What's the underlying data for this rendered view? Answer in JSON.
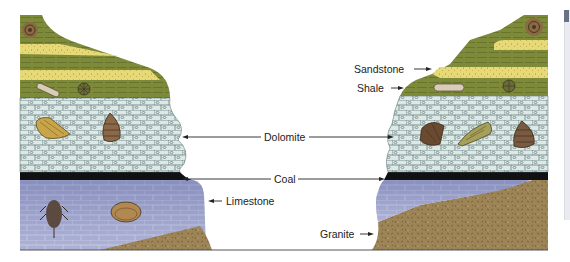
{
  "diagram": {
    "title": "",
    "labels": {
      "sandstone": "Sandstone",
      "shale": "Shale",
      "dolomite": "Dolomite",
      "coal": "Coal",
      "limestone": "Limestone",
      "granite": "Granite"
    },
    "layers_top_to_bottom": [
      "Shale / Sandstone (alternating)",
      "Dolomite",
      "Coal",
      "Limestone",
      "Granite"
    ],
    "fossils": {
      "left": [
        "ammonite",
        "crinoid-stem",
        "crinoid-disk",
        "horn-coral",
        "gastropod",
        "trilobite",
        "brachiopod"
      ],
      "right": [
        "ammonite",
        "crinoid-stem",
        "crinoid-disk",
        "brachiopod",
        "horn-coral",
        "gastropod"
      ]
    },
    "colors": {
      "shale": "#7d8a3a",
      "sandstone": "#e8d977",
      "dolomite": "#dde9e6",
      "coal": "#111111",
      "limestone": "#8e95c2",
      "granite": "#9c8457",
      "fossil": "#7a5a3a",
      "label_text": "#222222"
    }
  }
}
